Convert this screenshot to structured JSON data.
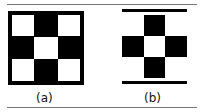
{
  "figure": {
    "panels": [
      {
        "label": "(a)",
        "description": "3x3 checkerboard with black border"
      },
      {
        "label": "(b)",
        "description": "plus-shaped cross with white center between two horizontal bars"
      }
    ]
  }
}
